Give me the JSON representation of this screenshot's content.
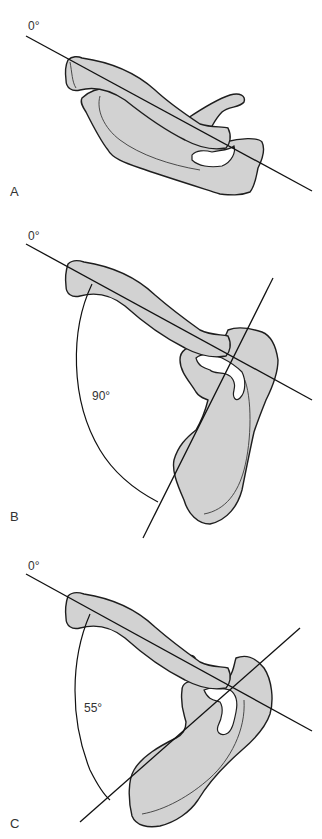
{
  "figure": {
    "panels": [
      {
        "id": "A",
        "label": "A",
        "reference_angle_label": "0°",
        "angle_label": ""
      },
      {
        "id": "B",
        "label": "B",
        "reference_angle_label": "0°",
        "angle_label": "90°"
      },
      {
        "id": "C",
        "label": "C",
        "reference_angle_label": "0°",
        "angle_label": "55°"
      }
    ],
    "colors": {
      "bone_fill": "#d2d2d2",
      "outline": "#1e1e1e",
      "background": "#ffffff",
      "text": "#333333"
    }
  }
}
